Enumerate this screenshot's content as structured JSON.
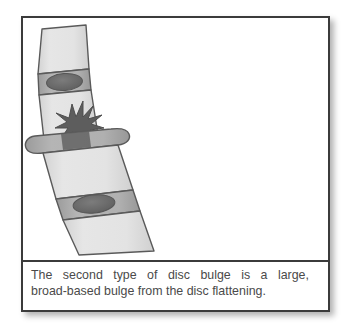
{
  "figure": {
    "caption": {
      "line1_words": [
        "The",
        "second",
        "type",
        "of",
        "disc",
        "bulge",
        "is",
        "a",
        "large,"
      ],
      "line2": "broad-based bulge from the disc flattening.",
      "full_text": "The second type of disc bulge is a large, broad-based bulge from the disc flattening.",
      "text_color": "#4a4a4a"
    },
    "frame": {
      "border_color": "#3b3b3b",
      "background": "#ffffff",
      "shadow_color": "#000000"
    },
    "illustration": {
      "title": "lumbar-spine-segment-with-broad-based-disc-bulge",
      "parts": [
        {
          "name": "upper-vertebral-body",
          "kind": "vertebra",
          "label": "Upper vertebral body"
        },
        {
          "name": "upper-intervertebral-disc",
          "kind": "disc",
          "label": "Normal intervertebral disc",
          "nucleus": "oval dark nucleus pulposus"
        },
        {
          "name": "middle-vertebral-body",
          "kind": "vertebra",
          "label": "Middle vertebral body"
        },
        {
          "name": "bulging-intervertebral-disc",
          "kind": "disc-bulge",
          "label": "Large broad-based bulging disc",
          "nucleus": "degenerated starburst nucleus pulposus"
        },
        {
          "name": "lower-vertebral-body",
          "kind": "vertebra",
          "label": "Lower vertebral body"
        },
        {
          "name": "lower-intervertebral-disc",
          "kind": "disc",
          "label": "Normal intervertebral disc",
          "nucleus": "oval dark nucleus pulposus"
        },
        {
          "name": "bottom-vertebral-body",
          "kind": "vertebra",
          "label": "Bottom vertebral body"
        }
      ],
      "colors": {
        "vertebra_fill": "#e0e0e0",
        "vertebra_fill_light": "#eaeaea",
        "disc_fill": "#a8a8a8",
        "disc_fill_light": "#bdbdbd",
        "nucleus_fill": "#6f6f6f",
        "nucleus_dark": "#5d5d5d",
        "outline": "#5a5a5a"
      }
    }
  }
}
